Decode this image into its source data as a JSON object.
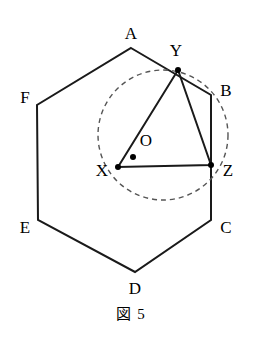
{
  "figure": {
    "caption": "図 5",
    "caption_x": 140,
    "caption_y": 302,
    "width": 262,
    "height": 347,
    "background_color": "#ffffff",
    "stroke_color": "#1a1a1a",
    "dashed_color": "#555555"
  },
  "hexagon": {
    "name": "regular-hexagon-ABCDEF",
    "stroke_width": 2,
    "vertices": [
      {
        "label": "A",
        "x": 131,
        "y": 48,
        "label_x": 131,
        "label_y": 33
      },
      {
        "label": "B",
        "x": 211,
        "y": 95,
        "label_x": 226,
        "label_y": 90
      },
      {
        "label": "C",
        "x": 211,
        "y": 220,
        "label_x": 226,
        "label_y": 227
      },
      {
        "label": "D",
        "x": 135,
        "y": 272,
        "label_x": 135,
        "label_y": 288
      },
      {
        "label": "E",
        "x": 38,
        "y": 220,
        "label_x": 25,
        "label_y": 227
      },
      {
        "label": "F",
        "x": 37,
        "y": 105,
        "label_x": 25,
        "label_y": 97
      }
    ]
  },
  "triangle": {
    "name": "triangle-XYZ",
    "stroke_width": 2,
    "vertices": [
      {
        "label": "X",
        "x": 118,
        "y": 167,
        "label_x": 102,
        "label_y": 170
      },
      {
        "label": "Y",
        "x": 178,
        "y": 70,
        "label_x": 176,
        "label_y": 50
      },
      {
        "label": "Z",
        "x": 211,
        "y": 165,
        "label_x": 228,
        "label_y": 170
      }
    ],
    "point_radius": 3
  },
  "circle": {
    "name": "dashed-circumcircle",
    "center_x": 163,
    "center_y": 135,
    "radius": 65,
    "stroke_width": 1.4,
    "dash_pattern": "5 4"
  },
  "center_point": {
    "label": "O",
    "dot_x": 133,
    "dot_y": 157,
    "dot_radius": 3,
    "label_x": 146,
    "label_y": 140
  }
}
